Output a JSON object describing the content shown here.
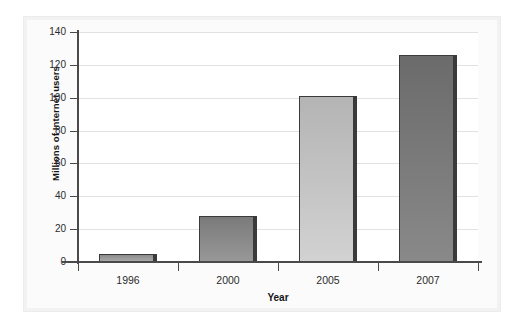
{
  "chart_data": {
    "type": "bar",
    "title": "",
    "subtitle": "",
    "categories": [
      "1996",
      "2000",
      "2005",
      "2007"
    ],
    "values": [
      5,
      28,
      101,
      126
    ],
    "xlabel": "Year",
    "ylabel": "Millions of Internet users",
    "ylim": [
      0,
      140
    ],
    "yticks": [
      0,
      20,
      40,
      60,
      80,
      100,
      120,
      140
    ],
    "ytick_labels": [
      "0",
      "20",
      "40",
      "60",
      "80",
      "100",
      "120",
      "140"
    ],
    "grid": true,
    "legend": false,
    "legend_position": "none",
    "bar_colors": [
      "#9a9a9a",
      "#8a8a8a",
      "#c4c4c4",
      "#7b7b7b"
    ],
    "bar_edge_color": "#3a3a3a",
    "grid_color": "#e2e2e2",
    "axis_color": "#4a4a4a",
    "plot_background": "#ffffff",
    "panel_background": "#f2f2f2"
  }
}
